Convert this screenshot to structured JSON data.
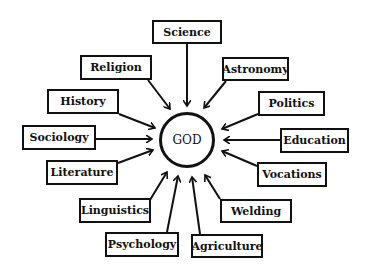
{
  "center": {
    "label": "GOD",
    "cx": 187,
    "cy": 140,
    "r": 28
  },
  "nodes": [
    {
      "label": "Science",
      "x": 152,
      "y": 20,
      "w": 70,
      "h": 24,
      "ax": 187,
      "ay": 44,
      "tx": 187,
      "ty": 106
    },
    {
      "label": "Religion",
      "x": 80,
      "y": 55,
      "w": 72,
      "h": 25,
      "ax": 148,
      "ay": 80,
      "tx": 170,
      "ty": 109
    },
    {
      "label": "Astronomy",
      "x": 222,
      "y": 57,
      "w": 67,
      "h": 24,
      "ax": 226,
      "ay": 81,
      "tx": 204,
      "ty": 108
    },
    {
      "label": "History",
      "x": 47,
      "y": 89,
      "w": 72,
      "h": 25,
      "ax": 119,
      "ay": 114,
      "tx": 155,
      "ty": 128
    },
    {
      "label": "Politics",
      "x": 258,
      "y": 91,
      "w": 67,
      "h": 25,
      "ax": 258,
      "ay": 114,
      "tx": 222,
      "ty": 129
    },
    {
      "label": "Sociology",
      "x": 22,
      "y": 125,
      "w": 74,
      "h": 25,
      "ax": 96,
      "ay": 139,
      "tx": 152,
      "ty": 139
    },
    {
      "label": "Education",
      "x": 280,
      "y": 128,
      "w": 69,
      "h": 25,
      "ax": 280,
      "ay": 140,
      "tx": 224,
      "ty": 140
    },
    {
      "label": "Literature",
      "x": 46,
      "y": 160,
      "w": 72,
      "h": 25,
      "ax": 118,
      "ay": 163,
      "tx": 153,
      "ty": 150
    },
    {
      "label": "Vocations",
      "x": 257,
      "y": 162,
      "w": 70,
      "h": 25,
      "ax": 257,
      "ay": 166,
      "tx": 222,
      "ty": 151
    },
    {
      "label": "Linguistics",
      "x": 79,
      "y": 198,
      "w": 72,
      "h": 25,
      "ax": 150,
      "ay": 200,
      "tx": 167,
      "ty": 172
    },
    {
      "label": "Welding",
      "x": 220,
      "y": 199,
      "w": 72,
      "h": 24,
      "ax": 220,
      "ay": 199,
      "tx": 205,
      "ty": 175
    },
    {
      "label": "Psychology",
      "x": 105,
      "y": 232,
      "w": 74,
      "h": 25,
      "ax": 167,
      "ay": 232,
      "tx": 178,
      "ty": 176
    },
    {
      "label": "Agriculture",
      "x": 191,
      "y": 234,
      "w": 72,
      "h": 24,
      "ax": 200,
      "ay": 234,
      "tx": 192,
      "ty": 177
    }
  ]
}
